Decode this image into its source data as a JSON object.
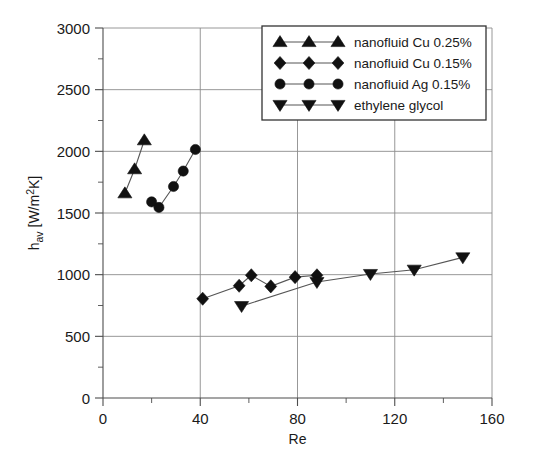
{
  "chart_data": {
    "type": "scatter",
    "title": "",
    "xlabel": "Re",
    "ylabel": "h_av [W/m2K]",
    "ylabel_parts": {
      "base": "h",
      "sub": "av",
      "unit_pre": " [W/m",
      "unit_sup": "2",
      "unit_post": "K]"
    },
    "xlim": [
      0,
      160
    ],
    "ylim": [
      0,
      3000
    ],
    "x_ticks": [
      0,
      40,
      80,
      120,
      160
    ],
    "x_tick_labels": [
      "0",
      "40",
      "80",
      "120",
      "160"
    ],
    "x_minor_step": 20,
    "y_ticks": [
      0,
      500,
      1000,
      1500,
      2000,
      2500,
      3000
    ],
    "y_tick_labels": [
      "0",
      "500",
      "1000",
      "1500",
      "2000",
      "2500",
      "3000"
    ],
    "y_minor_step": 250,
    "grid": "horizontal-and-vertical-major",
    "legend_position": "top-right",
    "series": [
      {
        "name": "nanofluid Cu 0.25%",
        "marker": "triangle-up",
        "points": [
          {
            "x": 9,
            "y": 1660
          },
          {
            "x": 13,
            "y": 1855
          },
          {
            "x": 17,
            "y": 2090
          }
        ]
      },
      {
        "name": "nanofluid Cu 0.15%",
        "marker": "diamond",
        "points": [
          {
            "x": 41,
            "y": 805
          },
          {
            "x": 56,
            "y": 910
          },
          {
            "x": 61,
            "y": 995
          },
          {
            "x": 69,
            "y": 905
          },
          {
            "x": 79,
            "y": 980
          },
          {
            "x": 88,
            "y": 995
          }
        ]
      },
      {
        "name": "nanofluid Ag 0.15%",
        "marker": "circle",
        "points": [
          {
            "x": 20,
            "y": 1590
          },
          {
            "x": 23,
            "y": 1545
          },
          {
            "x": 29,
            "y": 1715
          },
          {
            "x": 33,
            "y": 1840
          },
          {
            "x": 38,
            "y": 2015
          }
        ]
      },
      {
        "name": "ethylene glycol",
        "marker": "triangle-down",
        "points": [
          {
            "x": 57,
            "y": 745
          },
          {
            "x": 88,
            "y": 940
          },
          {
            "x": 110,
            "y": 1005
          },
          {
            "x": 128,
            "y": 1040
          },
          {
            "x": 148,
            "y": 1140
          }
        ]
      }
    ],
    "colors": {
      "marker": "#111111",
      "line": "#555555",
      "grid": "#8c8c8c",
      "axis": "#4d4d4d",
      "text": "#1a1a1a",
      "background": "#ffffff"
    }
  },
  "legend": {
    "entries": [
      {
        "label": "nanofluid Cu 0.25%",
        "marker": "triangle-up"
      },
      {
        "label": "nanofluid Cu 0.15%",
        "marker": "diamond"
      },
      {
        "label": "nanofluid Ag 0.15%",
        "marker": "circle"
      },
      {
        "label": "ethylene glycol",
        "marker": "triangle-down"
      }
    ]
  }
}
